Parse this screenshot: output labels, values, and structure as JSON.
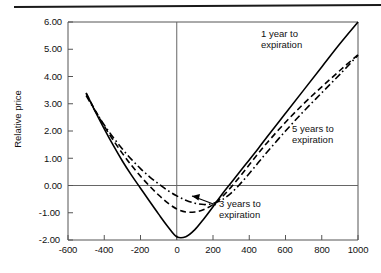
{
  "chart_data": {
    "type": "line",
    "title": "",
    "subtitle": "",
    "xlabel": "",
    "ylabel": "Relative price",
    "xlim": [
      -600,
      1000
    ],
    "ylim": [
      -2.0,
      6.0
    ],
    "grid": false,
    "legend_position": "inline-annotations",
    "x_ticks": [
      "-600",
      "-400",
      "-200",
      "0",
      "200",
      "400",
      "600",
      "800",
      "1000"
    ],
    "x_tick_values": [
      -600,
      -400,
      -200,
      0,
      200,
      400,
      600,
      800,
      1000
    ],
    "y_ticks": [
      "6.00",
      "5.00",
      "4.00",
      "3.00",
      "2.00",
      "1.00",
      "0.00",
      "-1.00",
      "-2.00"
    ],
    "y_tick_values": [
      6.0,
      5.0,
      4.0,
      3.0,
      2.0,
      1.0,
      0.0,
      -1.0,
      -2.0
    ],
    "zero_lines": {
      "x": 0,
      "y": 0.0
    },
    "series": [
      {
        "name": "1 year to expiration",
        "style": "solid",
        "color": "#000000",
        "x": [
          -500,
          -450,
          -400,
          -350,
          -300,
          -250,
          -200,
          -150,
          -100,
          -50,
          0,
          50,
          100,
          150,
          200,
          250,
          300,
          350,
          400,
          450,
          500,
          600,
          700,
          800,
          900,
          1000
        ],
        "y": [
          3.4,
          2.72,
          2.08,
          1.47,
          0.9,
          0.38,
          -0.1,
          -0.58,
          -1.05,
          -1.5,
          -1.88,
          -1.88,
          -1.62,
          -1.22,
          -0.78,
          -0.32,
          0.1,
          0.52,
          0.94,
          1.36,
          1.8,
          2.65,
          3.5,
          4.35,
          5.2,
          6.0
        ]
      },
      {
        "name": "3 years to expiration",
        "style": "dashed",
        "color": "#000000",
        "x": [
          -500,
          -450,
          -400,
          -350,
          -300,
          -250,
          -200,
          -150,
          -100,
          -50,
          0,
          50,
          100,
          150,
          200,
          250,
          300,
          350,
          400,
          450,
          500,
          600,
          700,
          800,
          900,
          1000
        ],
        "y": [
          3.38,
          2.76,
          2.18,
          1.66,
          1.18,
          0.74,
          0.34,
          -0.02,
          -0.35,
          -0.64,
          -0.86,
          -0.97,
          -0.97,
          -0.88,
          -0.7,
          -0.42,
          -0.06,
          0.34,
          0.76,
          1.18,
          1.58,
          2.32,
          3.0,
          3.62,
          4.22,
          4.8
        ]
      },
      {
        "name": "5 years to expiration",
        "style": "dashdot",
        "color": "#000000",
        "x": [
          -500,
          -450,
          -400,
          -350,
          -300,
          -250,
          -200,
          -150,
          -100,
          -50,
          0,
          50,
          100,
          150,
          200,
          250,
          300,
          350,
          400,
          450,
          500,
          600,
          700,
          800,
          900,
          1000
        ],
        "y": [
          3.3,
          2.74,
          2.22,
          1.76,
          1.34,
          0.96,
          0.62,
          0.32,
          0.06,
          -0.18,
          -0.38,
          -0.54,
          -0.65,
          -0.7,
          -0.66,
          -0.52,
          -0.28,
          0.06,
          0.44,
          0.84,
          1.24,
          2.0,
          2.72,
          3.4,
          4.08,
          4.78
        ]
      }
    ],
    "annotations": [
      {
        "key": "ann1",
        "line1": "1 year to",
        "line2": "expiration",
        "target_series": "1 year to expiration"
      },
      {
        "key": "ann5",
        "line1": "5 years to",
        "line2": "expiration",
        "target_series": "5 years to expiration"
      },
      {
        "key": "ann3",
        "line1": "3 years to",
        "line2": "expiration",
        "target_series": "3 years to expiration",
        "has_leader": true
      }
    ]
  },
  "axes": {
    "y_label": "Relative price"
  }
}
